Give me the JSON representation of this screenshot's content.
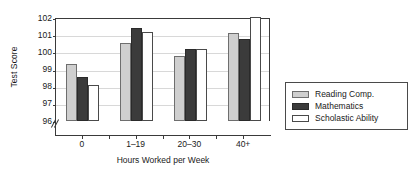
{
  "chart_data": {
    "type": "bar",
    "title": "",
    "xlabel": "Hours Worked per Week",
    "ylabel": "Test Score",
    "categories": [
      "0",
      "1–19",
      "20–30",
      "40+"
    ],
    "yticks": [
      96,
      97,
      98,
      99,
      100,
      101,
      102
    ],
    "ytick_labels": [
      "96",
      "97",
      "98",
      "99",
      "100",
      "101",
      "102"
    ],
    "ylim": [
      96,
      102
    ],
    "axis_break": true,
    "grid": true,
    "legend_position": "right",
    "series": [
      {
        "name": "Reading Comp.",
        "color": "#cfcfcf",
        "values": [
          99.35,
          100.55,
          99.8,
          101.15
        ]
      },
      {
        "name": "Mathematics",
        "color": "#3b3b3b",
        "values": [
          98.55,
          101.4,
          100.2,
          100.75
        ]
      },
      {
        "name": "Scholastic Ability",
        "color": "#ffffff",
        "values": [
          98.1,
          101.2,
          100.2,
          102.4
        ]
      }
    ]
  },
  "axis": {
    "y_title": "Test Score",
    "x_title": "Hours Worked per Week"
  },
  "legend": {
    "entries": [
      {
        "label": "Reading Comp."
      },
      {
        "label": "Mathematics"
      },
      {
        "label": "Scholastic Ability"
      }
    ]
  }
}
